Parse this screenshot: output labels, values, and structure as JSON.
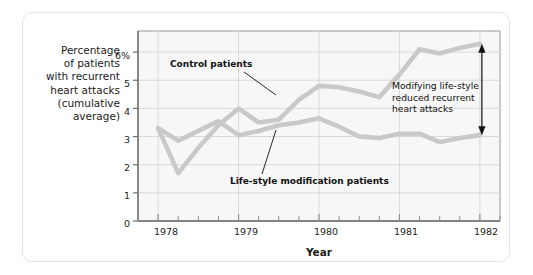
{
  "figure": {
    "background_color": "#ffffff",
    "card_border_color": "#e2e2e2",
    "plot_background_color": "#f7f7f7",
    "grid_color": "#d9d9d9",
    "axis_color": "#8c8c8c",
    "series_color": "#c9c9c9",
    "annotation_color": "#111111"
  },
  "chart_data": {
    "type": "line",
    "title": "",
    "xlabel": "Year",
    "ylabel": "Percentage\nof patients\nwith recurrent\nheart attacks\n(cumulative\naverage)",
    "ylabel_lines": [
      "Percentage",
      "of patients",
      "with recurrent",
      "heart attacks",
      "(cumulative",
      "average)"
    ],
    "xlim": [
      1977.75,
      1982.25
    ],
    "ylim": [
      0,
      6.75
    ],
    "grid": true,
    "legend_position": "inline-annotations",
    "yticks": [
      0,
      1,
      2,
      3,
      4,
      5,
      6
    ],
    "ytick_labels": [
      "0",
      "1",
      "2",
      "3",
      "4",
      "5",
      "6%"
    ],
    "xticks": [
      1978,
      1979,
      1980,
      1981,
      1982
    ],
    "xtick_labels": [
      "1978",
      "1979",
      "1980",
      "1981",
      "1982"
    ],
    "x_minor_tick_interval": 0.25,
    "series": [
      {
        "name": "Control patients",
        "color": "#c9c9c9",
        "x": [
          1978.0,
          1978.25,
          1978.5,
          1978.75,
          1979.0,
          1979.25,
          1979.5,
          1979.75,
          1980.0,
          1980.25,
          1980.5,
          1980.75,
          1981.0,
          1981.25,
          1981.5,
          1981.75,
          1982.0
        ],
        "values": [
          3.3,
          1.7,
          2.6,
          3.4,
          4.0,
          3.5,
          3.6,
          4.3,
          4.8,
          4.75,
          4.6,
          4.4,
          5.2,
          6.1,
          5.95,
          6.15,
          6.3
        ]
      },
      {
        "name": "Life-style modification patients",
        "color": "#c9c9c9",
        "x": [
          1978.0,
          1978.25,
          1978.5,
          1978.75,
          1979.0,
          1979.25,
          1979.5,
          1979.75,
          1980.0,
          1980.25,
          1980.5,
          1980.75,
          1981.0,
          1981.25,
          1981.5,
          1981.75,
          1982.0
        ],
        "values": [
          3.3,
          2.85,
          3.2,
          3.55,
          3.05,
          3.2,
          3.4,
          3.5,
          3.65,
          3.35,
          3.0,
          2.95,
          3.1,
          3.1,
          2.8,
          2.95,
          3.05
        ]
      }
    ],
    "annotations": [
      {
        "id": "control-patients-label",
        "text": "Control patients",
        "bold": true
      },
      {
        "id": "lifestyle-patients-label",
        "text": "Life-style modification patients",
        "bold": true
      },
      {
        "id": "conclusion-label",
        "text": "Modifying life-style\nreduced recurrent\nheart attacks",
        "bold": false,
        "lines": [
          "Modifying life-style",
          "reduced recurrent",
          "heart attacks"
        ]
      }
    ],
    "arrow": {
      "id": "gap-arrow",
      "type": "double-headed-vertical",
      "from_value": 6.3,
      "to_value": 3.05,
      "at_x": 1982.0
    }
  }
}
